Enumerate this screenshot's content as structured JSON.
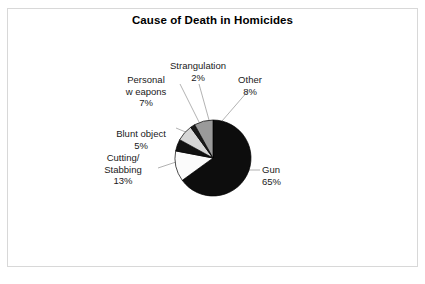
{
  "chart_data": {
    "type": "pie",
    "title": "Cause of Death in Homicides",
    "categories": [
      "Gun",
      "Cutting/ Stabbing",
      "Blunt object",
      "Personal w eapons",
      "Strangulation",
      "Other"
    ],
    "values": [
      65,
      13,
      5,
      7,
      2,
      8
    ],
    "value_suffix": "%",
    "slices": [
      {
        "label": "Gun",
        "value": 65,
        "display_value": "65%",
        "color": "#0d0d0d",
        "start_deg": 0,
        "end_deg": 234
      },
      {
        "label": "Cutting/ Stabbing",
        "value": 13,
        "display_value": "13%",
        "color": "#fbfbfb",
        "start_deg": 234,
        "end_deg": 280.8
      },
      {
        "label": "Blunt object",
        "value": 5,
        "display_value": "5%",
        "color": "#111111",
        "start_deg": 280.8,
        "end_deg": 298.8
      },
      {
        "label": "Personal w eapons",
        "value": 7,
        "display_value": "7%",
        "color": "#d6d6d6",
        "start_deg": 298.8,
        "end_deg": 324
      },
      {
        "label": "Strangulation",
        "value": 2,
        "display_value": "2%",
        "color": "#1a1a1a",
        "start_deg": 324,
        "end_deg": 331.2
      },
      {
        "label": "Other",
        "value": 8,
        "display_value": "8%",
        "color": "#9a9a9a",
        "start_deg": 331.2,
        "end_deg": 360
      }
    ],
    "legend": "none",
    "grid": false,
    "xlabel": "",
    "ylabel": "",
    "total": 100,
    "outline_color": "#000000",
    "background_color": "#ffffff",
    "frame_color": "#d8d8d8"
  },
  "title": "Cause of Death in Homicides",
  "labels": {
    "strangulation": {
      "name": "Strangulation",
      "pct": "2%"
    },
    "personal": {
      "name_line1": "Personal",
      "name_line2": "w eapons",
      "pct": "7%"
    },
    "other": {
      "name": "Other",
      "pct": "8%"
    },
    "blunt": {
      "name": "Blunt object",
      "pct": "5%"
    },
    "cutting": {
      "name_line1": "Cutting/",
      "name_line2": "Stabbing",
      "pct": "13%"
    },
    "gun": {
      "name": "Gun",
      "pct": "65%"
    }
  }
}
